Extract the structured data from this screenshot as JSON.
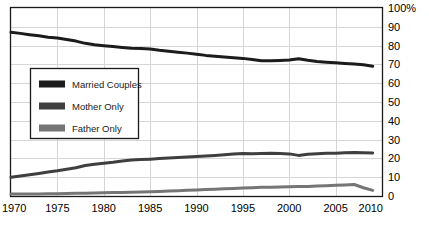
{
  "chart_data": {
    "type": "line",
    "title": "",
    "subtitle": "",
    "xlabel": "",
    "ylabel": "",
    "xlim": [
      1970,
      2010
    ],
    "ylim": [
      0,
      100
    ],
    "grid": true,
    "legend_position": "inside-left",
    "x_tick_labels": [
      "1970",
      "1975",
      "1980",
      "1985",
      "1990",
      "1995",
      "2000",
      "2005",
      "2010"
    ],
    "x_ticks": [
      1970,
      1975,
      1980,
      1985,
      1990,
      1995,
      2000,
      2005,
      2010
    ],
    "y_tick_labels": [
      "0",
      "10",
      "20",
      "30",
      "40",
      "50",
      "60",
      "70",
      "80",
      "90",
      "100%"
    ],
    "y_ticks": [
      0,
      10,
      20,
      30,
      40,
      50,
      60,
      70,
      80,
      90,
      100
    ],
    "y_axis_side": "right",
    "x": [
      1970,
      1971,
      1972,
      1973,
      1974,
      1975,
      1976,
      1977,
      1978,
      1979,
      1980,
      1981,
      1982,
      1983,
      1984,
      1985,
      1986,
      1987,
      1988,
      1989,
      1990,
      1991,
      1992,
      1993,
      1994,
      1995,
      1996,
      1997,
      1998,
      1999,
      2000,
      2001,
      2002,
      2003,
      2004,
      2005,
      2006,
      2007,
      2008,
      2009
    ],
    "series": [
      {
        "name": "Married Couples",
        "color": "#1c1c1c",
        "values": [
          87.1,
          86.5,
          85.8,
          85.2,
          84.5,
          84.0,
          83.2,
          82.4,
          81.2,
          80.4,
          79.9,
          79.5,
          79.0,
          78.6,
          78.5,
          78.2,
          77.5,
          77.0,
          76.5,
          76.0,
          75.4,
          74.8,
          74.4,
          74.0,
          73.6,
          73.2,
          72.6,
          71.9,
          72.0,
          72.1,
          72.3,
          73.0,
          72.2,
          71.6,
          71.2,
          70.9,
          70.5,
          70.2,
          69.8,
          69.0
        ]
      },
      {
        "name": "Mother Only",
        "color": "#3f3f3f",
        "values": [
          10.0,
          10.6,
          11.3,
          12.0,
          12.8,
          13.4,
          14.2,
          15.0,
          16.2,
          16.9,
          17.4,
          17.9,
          18.6,
          19.2,
          19.4,
          19.6,
          19.9,
          20.2,
          20.5,
          20.8,
          21.0,
          21.3,
          21.6,
          21.9,
          22.3,
          22.6,
          22.5,
          22.6,
          22.7,
          22.6,
          22.4,
          21.6,
          22.2,
          22.5,
          22.7,
          22.8,
          23.0,
          23.2,
          23.0,
          22.9
        ]
      },
      {
        "name": "Father Only",
        "color": "#757575",
        "values": [
          1.0,
          1.0,
          1.1,
          1.1,
          1.2,
          1.2,
          1.3,
          1.4,
          1.5,
          1.6,
          1.7,
          1.8,
          1.9,
          2.0,
          2.1,
          2.2,
          2.4,
          2.6,
          2.8,
          3.0,
          3.2,
          3.4,
          3.6,
          3.8,
          4.0,
          4.2,
          4.4,
          4.6,
          4.7,
          4.8,
          4.9,
          5.0,
          5.1,
          5.3,
          5.5,
          5.7,
          5.9,
          6.1,
          4.4,
          3.0
        ]
      }
    ]
  },
  "legend": {
    "items": [
      {
        "label": "Married Couples",
        "color": "#1c1c1c"
      },
      {
        "label": "Mother Only",
        "color": "#3f3f3f"
      },
      {
        "label": "Father Only",
        "color": "#757575"
      }
    ]
  },
  "colors": {
    "frame": "#1a1a1a",
    "grid": "#d6d6d6",
    "background": "#ffffff",
    "legend_border": "#1a1a1a",
    "legend_fill": "#ffffff",
    "tick_text": "#000000"
  }
}
